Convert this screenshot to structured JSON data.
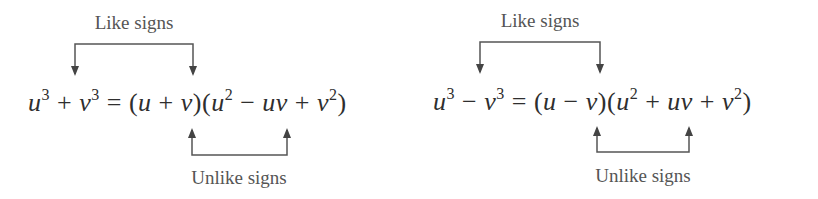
{
  "panels": [
    {
      "top_label": "Like signs",
      "bottom_label": "Unlike signs",
      "equation": {
        "lhs": [
          {
            "var": "u",
            "exp": "3"
          },
          {
            "op": "+"
          },
          {
            "var": "v",
            "exp": "3"
          }
        ],
        "equals": "=",
        "factor1": {
          "open": "(",
          "a": "u",
          "op": "+",
          "b": "v",
          "close": ")"
        },
        "factor2": {
          "open": "(",
          "t1": {
            "var": "u",
            "exp": "2"
          },
          "op1": "−",
          "t2": "uv",
          "op2": "+",
          "t3": {
            "var": "v",
            "exp": "2"
          },
          "close": ")"
        }
      },
      "text": "u³ + v³ = (u + v)(u² − uv + v²)"
    },
    {
      "top_label": "Like signs",
      "bottom_label": "Unlike signs",
      "equation": {
        "lhs": [
          {
            "var": "u",
            "exp": "3"
          },
          {
            "op": "−"
          },
          {
            "var": "v",
            "exp": "3"
          }
        ],
        "equals": "=",
        "factor1": {
          "open": "(",
          "a": "u",
          "op": "−",
          "b": "v",
          "close": ")"
        },
        "factor2": {
          "open": "(",
          "t1": {
            "var": "u",
            "exp": "2"
          },
          "op1": "+",
          "t2": "uv",
          "op2": "+",
          "t3": {
            "var": "v",
            "exp": "2"
          },
          "close": ")"
        }
      },
      "text": "u³ − v³ = (u − v)(u² + uv + v²)"
    }
  ],
  "colors": {
    "text": "#2e2e2e",
    "label": "#555555",
    "arrow": "#444444"
  }
}
